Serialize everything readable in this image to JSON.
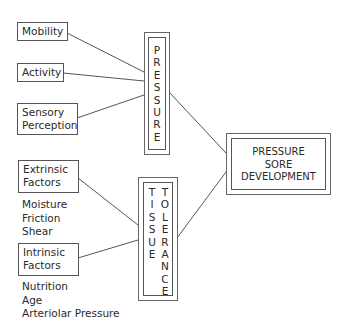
{
  "diagram": {
    "pressure_factors": [
      {
        "label": "Mobility"
      },
      {
        "label": "Activity"
      },
      {
        "label": "Sensory Perception",
        "lines": [
          "Sensory",
          "Perception"
        ]
      }
    ],
    "pressure_label": "PRESSURE",
    "tissue_factors": [
      {
        "label": "Extrinsic Factors",
        "lines": [
          "Extrinsic",
          "Factors"
        ],
        "examples": [
          "Moisture",
          "Friction",
          "Shear"
        ]
      },
      {
        "label": "Intrinsic Factors",
        "lines": [
          "Intrinsic",
          "Factors"
        ],
        "examples": [
          "Nutrition",
          "Age",
          "Arteriolar Pressure"
        ]
      }
    ],
    "tissue_label_col1": "TISSUE",
    "tissue_label_col2": "TOLERANCE",
    "outcome": {
      "lines": [
        "PRESSURE",
        "SORE",
        "DEVELOPMENT"
      ]
    },
    "line_color": "#555555"
  }
}
